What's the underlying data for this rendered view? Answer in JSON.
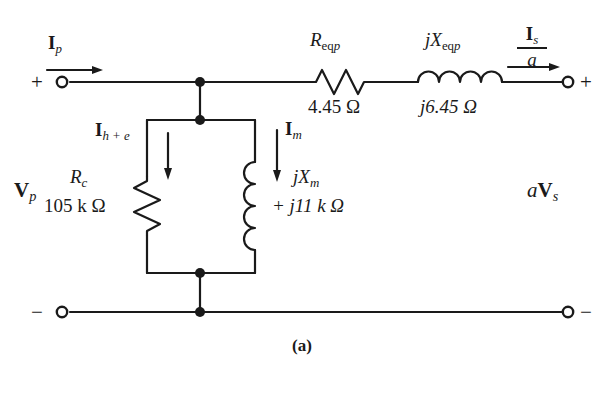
{
  "figure": {
    "caption": "(a)",
    "type": "transformer-equivalent-circuit-diagram"
  },
  "terminals": {
    "top_left_polarity": "+",
    "bottom_left_polarity": "−",
    "top_right_polarity": "+",
    "bottom_right_polarity": "−"
  },
  "currents": {
    "primary": {
      "symbol": "I",
      "subscript": "p"
    },
    "core_loss": {
      "symbol": "I",
      "subscript": "h + e"
    },
    "magnetizing": {
      "symbol": "I",
      "subscript": "m"
    },
    "secondary_referred": {
      "numerator_symbol": "I",
      "numerator_subscript": "s",
      "denominator": "a"
    }
  },
  "voltages": {
    "primary": {
      "symbol": "V",
      "subscript": "p"
    },
    "secondary_referred": {
      "prefix": "a",
      "symbol": "V",
      "subscript": "s"
    }
  },
  "components": [
    {
      "id": "req-p",
      "kind": "resistor",
      "name_main": "R",
      "name_sub": "eq",
      "name_sub2": "p",
      "value": "4.45 Ω"
    },
    {
      "id": "jxeq-p",
      "kind": "inductor",
      "name_main": "jX",
      "name_sub": "eq",
      "name_sub2": "p",
      "value": "j6.45 Ω"
    },
    {
      "id": "rc",
      "kind": "resistor",
      "name_main": "R",
      "name_sub": "c",
      "value": "105 k Ω"
    },
    {
      "id": "jxm",
      "kind": "inductor",
      "name_main": "jX",
      "name_sub": "m",
      "value": "+ j11 k Ω"
    }
  ],
  "colors": {
    "line": "#1a1a1a",
    "text": "#1a1a1a",
    "background": "#ffffff"
  }
}
